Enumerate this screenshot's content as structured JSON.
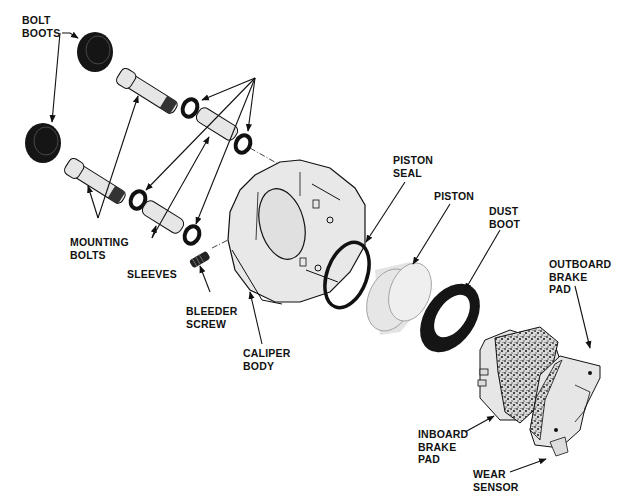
{
  "diagram": {
    "title": "",
    "type": "exploded-view",
    "colors": {
      "ink": "#111111",
      "part_fill": "#e6e6e6",
      "part_shade": "#cfcfcf",
      "rubber": "#151515",
      "background": "#ffffff"
    },
    "labels": {
      "bolt_boots": {
        "line1": "BOLT",
        "line2": "BOOTS"
      },
      "mounting_bolts": {
        "line1": "MOUNTING",
        "line2": "BOLTS"
      },
      "sleeves": {
        "line1": "SLEEVES"
      },
      "bleeder_screw": {
        "line1": "BLEEDER",
        "line2": "SCREW"
      },
      "caliper_body": {
        "line1": "CALIPER",
        "line2": "BODY"
      },
      "piston_seal": {
        "line1": "PISTON",
        "line2": "SEAL"
      },
      "piston": {
        "line1": "PISTON"
      },
      "dust_boot": {
        "line1": "DUST",
        "line2": "BOOT"
      },
      "outboard_brake_pad": {
        "line1": "OUTBOARD",
        "line2": "BRAKE",
        "line3": "PAD"
      },
      "inboard_brake_pad": {
        "line1": "INBOARD",
        "line2": "BRAKE",
        "line3": "PAD"
      },
      "wear_sensor": {
        "line1": "WEAR",
        "line2": "SENSOR"
      }
    },
    "parts": [
      "bolt-boot",
      "bolt-boot",
      "mounting-bolt",
      "mounting-bolt",
      "bushing",
      "bushing",
      "bushing",
      "bushing",
      "sleeve",
      "sleeve",
      "bleeder-screw",
      "caliper-body",
      "piston-seal",
      "piston",
      "dust-boot",
      "inboard-brake-pad",
      "outboard-brake-pad",
      "wear-sensor"
    ]
  }
}
